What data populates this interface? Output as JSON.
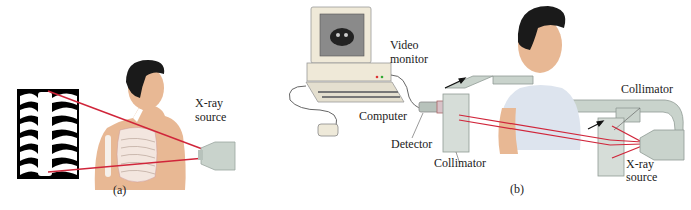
{
  "panel_a": {
    "label": "(a)",
    "xray_source_label": [
      "X-ray",
      "source"
    ]
  },
  "panel_b": {
    "label": "(b)",
    "video_monitor_label": [
      "Video",
      "monitor"
    ],
    "computer_label": "Computer",
    "detector_label": "Detector",
    "collimator_left_label": "Collimator",
    "collimator_right_label": "Collimator",
    "xray_source_label": [
      "X-ray",
      "source"
    ]
  },
  "colors": {
    "beam": "#d0253a",
    "skin": "#e8b894",
    "hair": "#1a1a1a",
    "gown": "#dde4ee",
    "apparatus": "#c9d3cc",
    "computer": "#efe9d8"
  }
}
